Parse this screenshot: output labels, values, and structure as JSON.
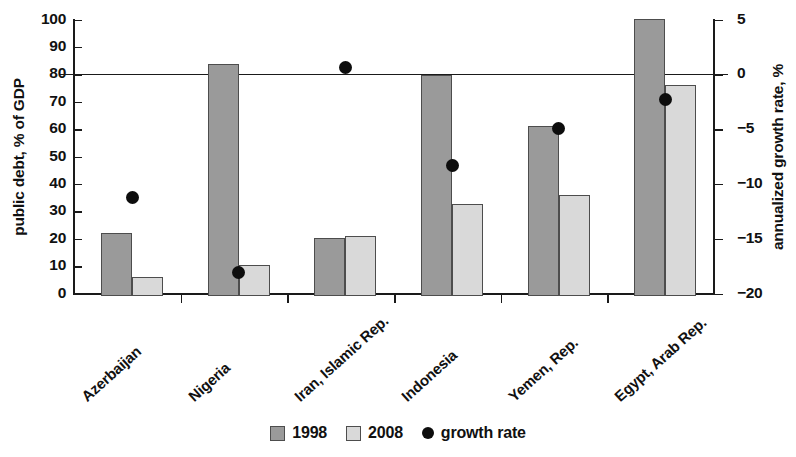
{
  "chart_data": {
    "type": "bar",
    "title": "",
    "subtitle": "",
    "categories": [
      "Azerbaijan",
      "Nigeria",
      "Iran, Islamic Rep.",
      "Indonesia",
      "Yemen, Rep.",
      "Egypt, Arab Rep."
    ],
    "series": [
      {
        "name": "1998",
        "axis": "left",
        "color": "#9a9a9a",
        "values": [
          23,
          84.5,
          21,
          80.5,
          62,
          101
        ]
      },
      {
        "name": "2008",
        "axis": "left",
        "color": "#d9d9d9",
        "values": [
          7,
          11.5,
          22,
          33.5,
          37,
          77
        ]
      },
      {
        "name": "growth rate",
        "axis": "right",
        "type": "scatter",
        "color": "#0d0d0d",
        "values": [
          -11.2,
          -18.1,
          0.6,
          -8.3,
          -4.9,
          -2.3
        ]
      }
    ],
    "xlabel": "",
    "ylabel": "public debt, % of GDP",
    "y2label": "annualized growth rate, %",
    "ylim": [
      0,
      100
    ],
    "y2lim": [
      -20,
      5
    ],
    "yticks": [
      0,
      10,
      20,
      30,
      40,
      50,
      60,
      70,
      80,
      90,
      100
    ],
    "y2ticks": [
      -20,
      -15,
      -10,
      -5,
      0,
      5
    ],
    "ytick_labels": [
      "0",
      "10",
      "20",
      "30",
      "40",
      "50",
      "60",
      "70",
      "80",
      "90",
      "100"
    ],
    "y2tick_labels": [
      "−20",
      "−15",
      "−10",
      "−5",
      "0",
      "5"
    ],
    "grid": false,
    "legend_position": "bottom-center",
    "reference_line": {
      "left_value": 80,
      "right_value": 0,
      "label": ""
    }
  },
  "axes": {
    "left": {
      "title": "public debt, % of GDP",
      "ticks": [
        {
          "label": "100",
          "value": 100
        },
        {
          "label": "90",
          "value": 90
        },
        {
          "label": "80",
          "value": 80
        },
        {
          "label": "70",
          "value": 70
        },
        {
          "label": "60",
          "value": 60
        },
        {
          "label": "50",
          "value": 50
        },
        {
          "label": "40",
          "value": 40
        },
        {
          "label": "30",
          "value": 30
        },
        {
          "label": "20",
          "value": 20
        },
        {
          "label": "10",
          "value": 10
        },
        {
          "label": "0",
          "value": 0
        }
      ]
    },
    "right": {
      "title": "annualized growth rate, %",
      "ticks": [
        {
          "label": "5",
          "value": 5
        },
        {
          "label": "0",
          "value": 0
        },
        {
          "label": "−5",
          "value": -5
        },
        {
          "label": "−10",
          "value": -10
        },
        {
          "label": "−15",
          "value": -15
        },
        {
          "label": "−20",
          "value": -20
        }
      ]
    }
  },
  "legend": {
    "items": [
      {
        "label": "1998",
        "marker": "square-swatch-dark"
      },
      {
        "label": "2008",
        "marker": "square-swatch-light"
      },
      {
        "label": "growth rate",
        "marker": "black-dot"
      }
    ]
  }
}
